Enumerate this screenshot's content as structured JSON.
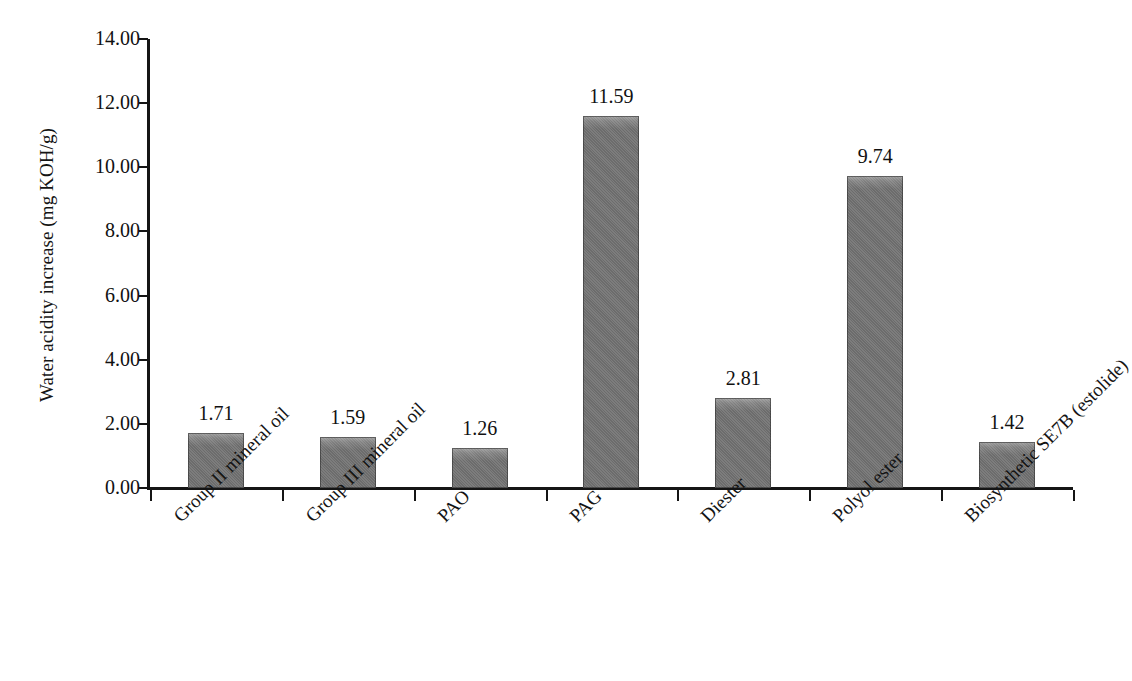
{
  "chart_data": {
    "type": "bar",
    "title": "",
    "xlabel": "",
    "ylabel": "Water acidity increase (mg KOH/g)",
    "ylim": [
      0,
      14
    ],
    "ytick_step": 2,
    "ytick_labels": [
      "14.00",
      "12.00",
      "10.00",
      "8.00",
      "6.00",
      "4.00",
      "2.00",
      "0.00"
    ],
    "ytick_values": [
      14,
      12,
      10,
      8,
      6,
      4,
      2,
      0
    ],
    "grid": false,
    "legend": false,
    "categories": [
      "Group II mineral oil",
      "Group III mineral oil",
      "PAO",
      "PAG",
      "Diester",
      "Polyol ester",
      "Biosynthetic SE7B (estolide)"
    ],
    "values": [
      1.71,
      1.59,
      1.26,
      11.59,
      2.81,
      9.74,
      1.42
    ],
    "value_labels": [
      "1.71",
      "1.59",
      "1.26",
      "11.59",
      "2.81",
      "9.74",
      "1.42"
    ],
    "bar_color": "#737373",
    "axis_color": "#151515",
    "text_color": "#111111"
  }
}
